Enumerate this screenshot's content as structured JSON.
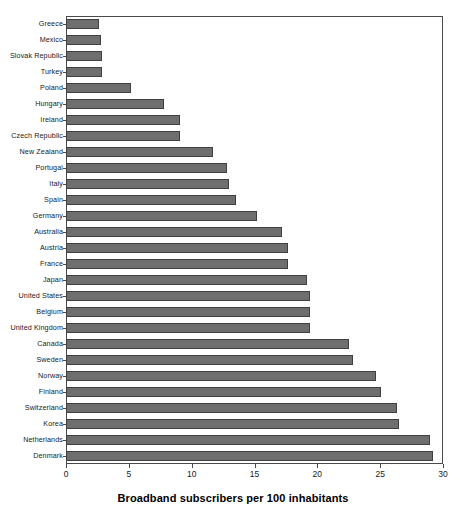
{
  "chart_data": {
    "type": "bar",
    "orientation": "horizontal",
    "title": "",
    "xlabel": "Broadband subscribers per 100 inhabitants",
    "ylabel": "",
    "xlim": [
      0,
      30
    ],
    "xticks": [
      0,
      5,
      10,
      15,
      20,
      25,
      30
    ],
    "xtick_labels": [
      "0",
      "5",
      "10",
      "15",
      "20",
      "25",
      "30"
    ],
    "grid": false,
    "legend": null,
    "bar_color": "#6e6e6e",
    "bar_edge_color": "#3f3f3f",
    "axis_color": "#4a4a4a",
    "categories": [
      "Greece",
      "Mexico",
      "Slovak Republic",
      "Turkey",
      "Poland",
      "Hungary",
      "Ireland",
      "Czech Republic",
      "New Zealand",
      "Portugal",
      "Italy",
      "Spain",
      "Germany",
      "Australia",
      "Austria",
      "France",
      "Japan",
      "United States",
      "Belgium",
      "United Kingdom",
      "Canada",
      "Sweden",
      "Norway",
      "Finland",
      "Switzerland",
      "Korea",
      "Netherlands",
      "Denmark"
    ],
    "values": [
      2.6,
      2.8,
      2.9,
      2.9,
      5.2,
      7.8,
      9.1,
      9.1,
      11.7,
      12.8,
      13.0,
      13.5,
      15.2,
      17.2,
      17.7,
      17.7,
      19.2,
      19.4,
      19.4,
      19.4,
      22.5,
      22.8,
      24.7,
      25.1,
      26.3,
      26.5,
      29.0,
      29.2
    ]
  }
}
